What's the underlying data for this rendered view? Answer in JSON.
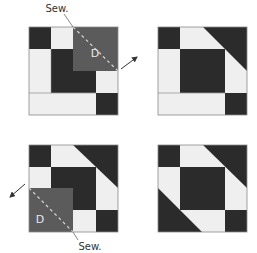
{
  "colors": {
    "dark": "#2b2b2b",
    "light": "#efefef",
    "d_patch": "#5b5b5b",
    "border": "#8a8a8a",
    "seam": "#d0d0d0",
    "arrow": "#333333"
  },
  "labels": {
    "sew_top": "Sew.",
    "d_top": "D",
    "sew_bottom": "Sew.",
    "d_bottom": "D"
  },
  "steps": [
    {
      "name": "step-1",
      "description": "Place square D on top-right corner, sew diagonally"
    },
    {
      "name": "step-2",
      "description": "Result: top-right corner flipped to triangle"
    },
    {
      "name": "step-3",
      "description": "Place square D on bottom-left corner, sew diagonally"
    },
    {
      "name": "step-4",
      "description": "Finished block with both corners"
    }
  ]
}
